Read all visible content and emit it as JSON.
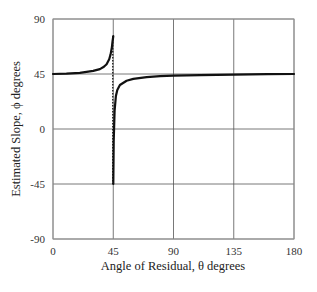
{
  "chart_data": {
    "type": "line",
    "title": "",
    "xlabel": "Angle of Residual, θ degrees",
    "ylabel": "Estimated Slope, ϕ degrees",
    "xlim": [
      0,
      180
    ],
    "ylim": [
      -90,
      90
    ],
    "xticks": [
      0,
      45,
      90,
      135,
      180
    ],
    "yticks": [
      90,
      45,
      0,
      -45,
      -90
    ],
    "grid": true,
    "legend": null,
    "asymptote": {
      "x": 45,
      "style": "dotted",
      "y_range": [
        -45,
        76
      ]
    },
    "series": [
      {
        "name": "Estimated slope (θ < 45)",
        "x": [
          0,
          10,
          20,
          30,
          35,
          38,
          40,
          42,
          43,
          44,
          44.5,
          45
        ],
        "y": [
          45,
          45.3,
          46,
          47.5,
          49,
          51,
          53,
          57,
          61,
          67,
          72,
          76
        ]
      },
      {
        "name": "Estimated slope (θ > 45)",
        "x": [
          45,
          45.3,
          46,
          47,
          48,
          50,
          55,
          60,
          70,
          80,
          90,
          110,
          135,
          160,
          180
        ],
        "y": [
          -45,
          -10,
          15,
          27,
          32,
          36,
          39.5,
          41,
          42.5,
          43.2,
          43.6,
          44,
          44.5,
          44.8,
          45
        ]
      }
    ]
  }
}
